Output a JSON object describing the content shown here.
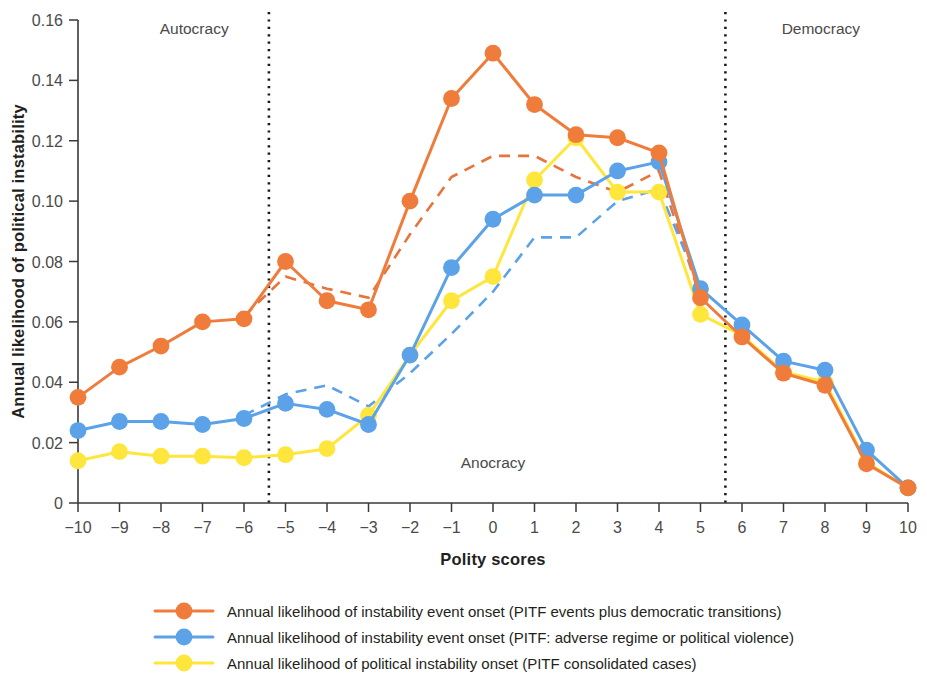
{
  "chart_data": {
    "type": "line",
    "title": "",
    "xlabel": "Polity scores",
    "ylabel": "Annual likelihood of political instability",
    "xlim": [
      -10,
      10
    ],
    "ylim": [
      0,
      0.16
    ],
    "ytick_labels": [
      "0",
      "0.02",
      "0.04",
      "0.06",
      "0.08",
      "0.10",
      "0.12",
      "0.14",
      "0.16"
    ],
    "ytick_values": [
      0,
      0.02,
      0.04,
      0.06,
      0.08,
      0.1,
      0.12,
      0.14,
      0.16
    ],
    "xtick_labels": [
      "−10",
      "−9",
      "−8",
      "−7",
      "−6",
      "−5",
      "−4",
      "−3",
      "−2",
      "−1",
      "0",
      "1",
      "2",
      "3",
      "4",
      "5",
      "6",
      "7",
      "8",
      "9",
      "10"
    ],
    "x": [
      -10,
      -9,
      -8,
      -7,
      -6,
      -5,
      -4,
      -3,
      -2,
      -1,
      0,
      1,
      2,
      3,
      4,
      5,
      6,
      7,
      8,
      9,
      10
    ],
    "grid": false,
    "legend_position": "bottom",
    "series": [
      {
        "name": "Annual likelihood of instability event onset (PITF events plus democratic transitions)",
        "color": "#F07C3C",
        "style": "solid-markers",
        "values": [
          0.035,
          0.045,
          0.052,
          0.06,
          0.061,
          0.08,
          0.067,
          0.064,
          0.1,
          0.134,
          0.149,
          0.132,
          0.122,
          0.121,
          0.116,
          0.068,
          0.055,
          0.043,
          0.039,
          0.013,
          0.005
        ]
      },
      {
        "name": "Annual likelihood of instability event onset (PITF: adverse regime or political violence)",
        "color": "#5BA2E8",
        "style": "solid-markers",
        "values": [
          0.024,
          0.027,
          0.027,
          0.026,
          0.028,
          0.033,
          0.031,
          0.026,
          0.049,
          0.078,
          0.094,
          0.102,
          0.102,
          0.11,
          0.113,
          0.071,
          0.059,
          0.047,
          0.044,
          0.0175,
          0.005
        ]
      },
      {
        "name": "Annual likelihood of political instability onset (PITF consolidated cases)",
        "color": "#FFE63C",
        "style": "solid-markers",
        "values": [
          0.014,
          0.017,
          0.0155,
          0.0155,
          0.015,
          0.016,
          0.018,
          0.029,
          0.049,
          0.067,
          0.075,
          0.107,
          0.121,
          0.103,
          0.103,
          0.0625,
          0.0555,
          0.0435,
          0.04,
          0.0135,
          0.005
        ]
      }
    ],
    "trend_series": [
      {
        "name": "Trend (PITF events plus democratic transitions)",
        "color": "#E8733C",
        "style": "dashed",
        "x": [
          -6,
          -5,
          -4,
          -3,
          -2,
          -1,
          0,
          1,
          2,
          3,
          4,
          5
        ],
        "values": [
          0.062,
          0.075,
          0.071,
          0.068,
          0.089,
          0.108,
          0.115,
          0.115,
          0.108,
          0.103,
          0.11,
          0.068
        ]
      },
      {
        "name": "Trend (PITF: adverse regime or political violence)",
        "color": "#5BA2E8",
        "style": "dashed",
        "x": [
          -6,
          -5,
          -4,
          -3,
          -2,
          -1,
          0,
          1,
          2,
          3,
          4,
          5
        ],
        "values": [
          0.029,
          0.036,
          0.039,
          0.032,
          0.043,
          0.056,
          0.07,
          0.088,
          0.088,
          0.1,
          0.104,
          0.071
        ]
      }
    ],
    "annotations": [
      {
        "text": "Autocracy",
        "x": -7.2,
        "y": 0.1555,
        "name": "autocracy-label"
      },
      {
        "text": "Anocracy",
        "x": 0.0,
        "y": 0.0115,
        "name": "anocracy-label"
      },
      {
        "text": "Democracy",
        "x": 7.9,
        "y": 0.1555,
        "name": "democracy-label"
      }
    ],
    "dividers": [
      {
        "name": "autocracy-anocracy-divider",
        "x": -5.4
      },
      {
        "name": "anocracy-democracy-divider",
        "x": 5.6
      }
    ],
    "colors": {
      "orange": "#F07C3C",
      "blue": "#5BA2E8",
      "yellow": "#FFE63C",
      "axis": "#3a3a3a",
      "text": "#231f20",
      "background": "#ffffff"
    }
  },
  "legend": {
    "items": [
      {
        "label": "Annual likelihood of instability event onset (PITF events plus democratic transitions)",
        "color": "#F07C3C"
      },
      {
        "label": "Annual likelihood of instability event onset (PITF: adverse regime or political violence)",
        "color": "#5BA2E8"
      },
      {
        "label": "Annual likelihood of political instability onset (PITF consolidated cases)",
        "color": "#FFE63C"
      }
    ]
  }
}
